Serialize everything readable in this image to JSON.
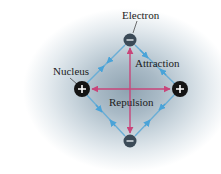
{
  "diagram": {
    "labels": {
      "electron": "Electron",
      "nucleus": "Nucleus",
      "attraction": "Attraction",
      "repulsion": "Repulsion"
    },
    "nodes": [
      {
        "id": "nucleus-left",
        "type": "nucleus",
        "charge": "+",
        "x": 82,
        "y": 89
      },
      {
        "id": "nucleus-right",
        "type": "nucleus",
        "charge": "+",
        "x": 180,
        "y": 89
      },
      {
        "id": "electron-top",
        "type": "electron",
        "charge": "−",
        "x": 130,
        "y": 40
      },
      {
        "id": "electron-bottom",
        "type": "electron",
        "charge": "−",
        "x": 130,
        "y": 141
      }
    ],
    "relations": [
      {
        "type": "attraction",
        "from": "nucleus-left",
        "to": "electron-top"
      },
      {
        "type": "attraction",
        "from": "nucleus-right",
        "to": "electron-top"
      },
      {
        "type": "attraction",
        "from": "nucleus-left",
        "to": "electron-bottom"
      },
      {
        "type": "attraction",
        "from": "nucleus-right",
        "to": "electron-bottom"
      },
      {
        "type": "repulsion",
        "from": "nucleus-left",
        "to": "nucleus-right"
      },
      {
        "type": "repulsion",
        "from": "electron-top",
        "to": "electron-bottom"
      }
    ],
    "colors": {
      "attraction": "#4aa3d8",
      "repulsion": "#c8457a",
      "nucleus": "#141414",
      "electron": "#3b4a57",
      "background_glow": "#8fa3b1"
    }
  }
}
